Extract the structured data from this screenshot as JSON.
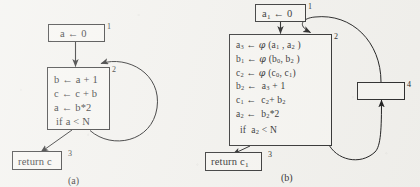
{
  "figure": {
    "background_color": "#f2f1ed",
    "ink_color": "#1b1b1b"
  },
  "panels": [
    {
      "id": "panel-a",
      "caption": "(a)",
      "nodes": [
        {
          "id": "a-node-1",
          "label": "1",
          "lines": [
            "a ← 0"
          ]
        },
        {
          "id": "a-node-2",
          "label": "2",
          "lines": [
            "b ← a + 1",
            "c ← c + b",
            "a ← b*2",
            "if a < N"
          ]
        },
        {
          "id": "a-node-3",
          "label": "3",
          "lines": [
            "return c"
          ]
        }
      ],
      "edges": [
        {
          "id": "a-edge-1-2",
          "kind": "straight",
          "from": "a-node-1",
          "to": "a-node-2"
        },
        {
          "id": "a-edge-2-3",
          "kind": "straight",
          "from": "a-node-2",
          "to": "a-node-3"
        },
        {
          "id": "a-edge-backedge",
          "kind": "curved-loop",
          "from": "a-node-2",
          "to": "a-node-2"
        }
      ]
    },
    {
      "id": "panel-b",
      "caption": "(b)",
      "nodes": [
        {
          "id": "b-node-1",
          "label": "1",
          "lines": [
            "a1 ← 0"
          ]
        },
        {
          "id": "b-node-2",
          "label": "2",
          "lines": [
            "a3 ← φ (a1 , a2 )",
            "b1 ← φ (b0, b2 )",
            "c2 ← φ (c0, c1)",
            "b2 ← a3 + 1",
            "c1 ← c2+ b2",
            "a2 ← b2*2",
            "if a2 < N"
          ]
        },
        {
          "id": "b-node-3",
          "label": "3",
          "lines": [
            "return c1"
          ]
        },
        {
          "id": "b-node-4",
          "label": "4",
          "lines": []
        }
      ],
      "edges": [
        {
          "id": "b-edge-1-2",
          "kind": "straight",
          "from": "b-node-1",
          "to": "b-node-2"
        },
        {
          "id": "b-edge-2-3",
          "kind": "straight",
          "from": "b-node-2",
          "to": "b-node-3"
        },
        {
          "id": "b-edge-2-4",
          "kind": "curved",
          "from": "b-node-2",
          "to": "b-node-4"
        },
        {
          "id": "b-edge-4-2",
          "kind": "curved",
          "from": "b-node-4",
          "to": "b-node-2"
        }
      ]
    }
  ],
  "text": {
    "a": {
      "n1_l1": "a ← 0",
      "n2_l1": "b ← a + 1",
      "n2_l2": "c ← c + b",
      "n2_l3": "a ← b*2",
      "n2_l4": "if a < N",
      "n3_l1": "return c",
      "lab1": "1",
      "lab2": "2",
      "lab3": "3",
      "caption": "(a)"
    },
    "b": {
      "lab1": "1",
      "lab2": "2",
      "lab3": "3",
      "lab4": "4",
      "caption": "(b)"
    }
  }
}
